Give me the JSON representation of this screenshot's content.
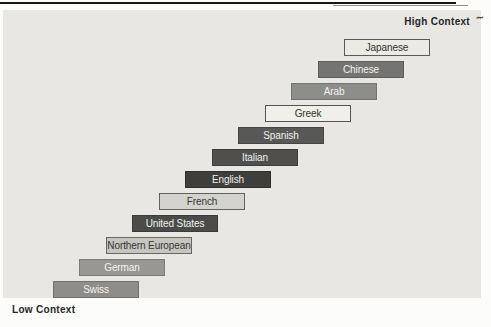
{
  "diagram": {
    "axis_high_label": "High Context",
    "axis_low_label": "Low Context",
    "annotation_mark": "~",
    "panel_color": "#e8e7e3",
    "items": [
      {
        "label": "Swiss",
        "fill": "#8e8d89",
        "ink": "#f4f3ef",
        "border": "#72716d"
      },
      {
        "label": "German",
        "fill": "#989792",
        "ink": "#f4f3ef",
        "border": "#7c7b76"
      },
      {
        "label": "Northern European",
        "fill": "#c6c5c0",
        "ink": "#38372f",
        "border": "#67665f"
      },
      {
        "label": "United States",
        "fill": "#4b4b49",
        "ink": "#f2f1ed",
        "border": "#3a3a38"
      },
      {
        "label": "French",
        "fill": "#d3d2cd",
        "ink": "#38372f",
        "border": "#62615c"
      },
      {
        "label": "English",
        "fill": "#3e3e3c",
        "ink": "#f2f1ed",
        "border": "#2f2f2d"
      },
      {
        "label": "Italian",
        "fill": "#4f4f4d",
        "ink": "#f2f1ed",
        "border": "#3d3d3b"
      },
      {
        "label": "Spanish",
        "fill": "#585856",
        "ink": "#f2f1ed",
        "border": "#464644"
      },
      {
        "label": "Greek",
        "fill": "#f0efea",
        "ink": "#33322c",
        "border": "#55544e"
      },
      {
        "label": "Arab",
        "fill": "#8d8d8b",
        "ink": "#f4f3ef",
        "border": "#737371"
      },
      {
        "label": "Chinese",
        "fill": "#747472",
        "ink": "#f4f3ef",
        "border": "#5d5d5b"
      },
      {
        "label": "Japanese",
        "fill": "#eceae5",
        "ink": "#33322c",
        "border": "#5a5953"
      }
    ]
  }
}
